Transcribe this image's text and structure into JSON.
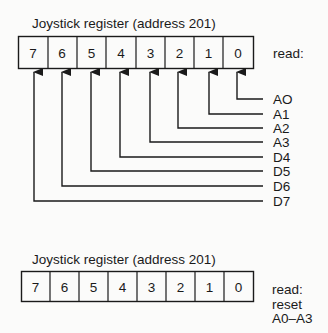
{
  "diagram_top": {
    "title": "Joystick register (address 201)",
    "bits": [
      "7",
      "6",
      "5",
      "4",
      "3",
      "2",
      "1",
      "0"
    ],
    "operation_label": "read:",
    "signals": [
      {
        "bit": "0",
        "label": "AO"
      },
      {
        "bit": "1",
        "label": "A1"
      },
      {
        "bit": "2",
        "label": "A2"
      },
      {
        "bit": "3",
        "label": "A3"
      },
      {
        "bit": "4",
        "label": "D4"
      },
      {
        "bit": "5",
        "label": "D5"
      },
      {
        "bit": "6",
        "label": "D6"
      },
      {
        "bit": "7",
        "label": "D7"
      }
    ]
  },
  "diagram_bottom": {
    "title": "Joystick register (address 201)",
    "bits": [
      "7",
      "6",
      "5",
      "4",
      "3",
      "2",
      "1",
      "0"
    ],
    "operation_lines": [
      "read:",
      "reset",
      "A0–A3"
    ]
  },
  "colors": {
    "line": "#1a1a1a",
    "background": "#fbfbfa"
  }
}
